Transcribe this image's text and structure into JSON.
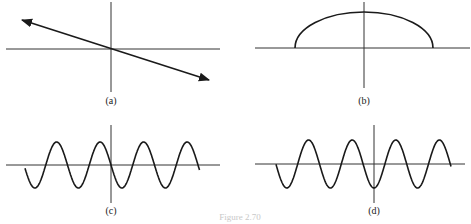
{
  "figure": {
    "caption": "Figure 2.70",
    "panels": [
      {
        "id": "a",
        "label": "(a)",
        "description": "straight line through origin with negative slope, arrows at both ends"
      },
      {
        "id": "b",
        "label": "(b)",
        "description": "upper half-ellipse (semicircle-like arc) centered on vertical axis, resting on horizontal axis"
      },
      {
        "id": "c",
        "label": "(c)",
        "description": "sinusoid passing through origin descending (like -sin), starting below axis on left"
      },
      {
        "id": "d",
        "label": "(d)",
        "description": "sinusoid with trough at origin (like -cos)"
      }
    ]
  },
  "colors": {
    "line": "#1a1a1a",
    "axis": "#333333",
    "background": "#ffffff"
  }
}
